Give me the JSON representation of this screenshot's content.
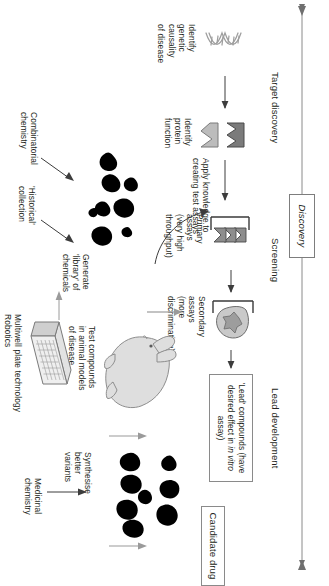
{
  "figure": {
    "type": "flowchart",
    "orientation": "rotated-90-clockwise",
    "title_axis": "Discovery"
  },
  "phases": {
    "axis_label_discovery": "Discovery",
    "stage_target_discovery": "Target discovery",
    "stage_screening": "Screening",
    "stage_lead_development": "Lead development"
  },
  "steps": {
    "identify_genetic": "Identify\ngenetic\ncausality\nof disease",
    "identify_protein": "Identify\nprotein\nfunction",
    "apply_knowledge": "Apply knowledge to\ncreating test assays",
    "primary_assays": "Primary\nassays\n(very high\nthroughput)",
    "secondary_assays": "Secondary\nassays\n(more\ndiscriminating)",
    "test_compounds": "Test compounds\nin animal models\nof disease",
    "synthesise_variants": "Synthesise\nbetter\nvariants"
  },
  "inputs": {
    "combinatorial_chemistry": "Combinatorial\nchemistry",
    "historical_collection": "'Historical'\ncollection",
    "generate_library": "Generate\n'library' of\nchemicals",
    "multiwell_plate": "Multiwell plate technology\nRobotics",
    "medicinal_chemistry": "Medicinal\nchemistry"
  },
  "boxes": {
    "lead_compounds_line1": "'Lead' compounds (have",
    "lead_compounds_line2_pre": "desired effect in ",
    "lead_compounds_line2_em": "in vitro",
    "lead_compounds_line2_post": " assay)",
    "candidate_drug": "Candidate drug"
  },
  "icons": {
    "dna": "dna-helix-icon",
    "protein_dark": "protein-receptor-dark-icon",
    "protein_light": "protein-receptor-light-icon",
    "compounds": "chemical-compounds-icon",
    "plate": "multiwell-plate-icon",
    "rabbit": "rabbit-animal-model-icon",
    "cell": "cell-assay-icon"
  },
  "colors": {
    "ink": "#231f20",
    "rule": "#8a8a8a",
    "well_fill": "#9a9a9a",
    "compound_fill": "#000000",
    "protein_dark": "#7b7b7b",
    "protein_light": "#b9b9b9"
  }
}
